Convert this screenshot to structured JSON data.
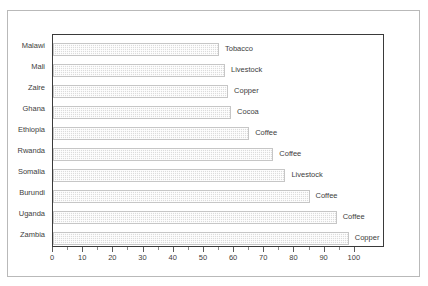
{
  "chart_data": {
    "type": "bar",
    "orientation": "horizontal",
    "title": "",
    "xlabel": "",
    "ylabel": "",
    "xlim": [
      0,
      110
    ],
    "grid": false,
    "legend": "none",
    "x_ticks": [
      0,
      10,
      20,
      30,
      40,
      50,
      60,
      70,
      80,
      90,
      100
    ],
    "x_minor_tick_step": 5,
    "categories": [
      "Malawi",
      "Mali",
      "Zaire",
      "Ghana",
      "Ethiopia",
      "Rwanda",
      "Somalia",
      "Burundi",
      "Uganda",
      "Zambia"
    ],
    "values": [
      55,
      57,
      58,
      59,
      65,
      73,
      77,
      85,
      94,
      98
    ],
    "point_labels": [
      "Tobacco",
      "Livestock",
      "Copper",
      "Cocoa",
      "Coffee",
      "Coffee",
      "Livestock",
      "Coffee",
      "Coffee",
      "Copper"
    ],
    "bars": [
      {
        "category": "Malawi",
        "value": 55,
        "label": "Tobacco"
      },
      {
        "category": "Mali",
        "value": 57,
        "label": "Livestock"
      },
      {
        "category": "Zaire",
        "value": 58,
        "label": "Copper"
      },
      {
        "category": "Ghana",
        "value": 59,
        "label": "Cocoa"
      },
      {
        "category": "Ethiopia",
        "value": 65,
        "label": "Coffee"
      },
      {
        "category": "Rwanda",
        "value": 73,
        "label": "Coffee"
      },
      {
        "category": "Somalia",
        "value": 77,
        "label": "Livestock"
      },
      {
        "category": "Burundi",
        "value": 85,
        "label": "Coffee"
      },
      {
        "category": "Uganda",
        "value": 94,
        "label": "Coffee"
      },
      {
        "category": "Zambia",
        "value": 98,
        "label": "Copper"
      }
    ],
    "colors": {
      "bar_fill": "#dcdcdc",
      "bar_edge": "#c6c6c6",
      "axis": "#3a3a3a",
      "text": "#3d3d3d",
      "figure_border": "#b9b9b9",
      "background": "#ffffff"
    }
  }
}
